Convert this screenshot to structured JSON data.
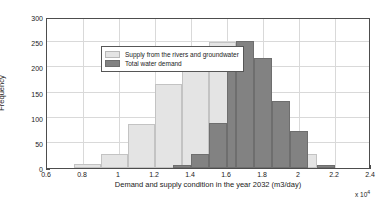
{
  "chart_data": {
    "type": "bar",
    "subtype": "histogram",
    "title": "",
    "xlabel": "Demand and supply condition in the year 2032 (m3/day)",
    "ylabel": "Frequency",
    "x_multiplier": "x 10",
    "x_multiplier_exponent": "4",
    "xlim": [
      0.6,
      2.4
    ],
    "ylim": [
      0,
      300
    ],
    "xticks": [
      0.6,
      0.8,
      1.0,
      1.2,
      1.4,
      1.6,
      1.8,
      2.0,
      2.2,
      2.4
    ],
    "xtick_labels": [
      "0.6",
      "0.8",
      "1",
      "1.2",
      "1.4",
      "1.6",
      "1.8",
      "2",
      "2.2",
      "2.4"
    ],
    "yticks": [
      0,
      50,
      100,
      150,
      200,
      250,
      300
    ],
    "ytick_labels": [
      "0",
      "50",
      "100",
      "150",
      "200",
      "250",
      "300"
    ],
    "grid": true,
    "legend_position": "upper left",
    "bin_width": 0.1,
    "series": [
      {
        "name": "Supply from the rivers and groundwater",
        "color": "#e4e4e4",
        "edge_color": "#c3c3c3",
        "bins": [
          {
            "start": 0.75,
            "end": 0.9,
            "value": 8
          },
          {
            "start": 0.9,
            "end": 1.05,
            "value": 28
          },
          {
            "start": 1.05,
            "end": 1.2,
            "value": 87
          },
          {
            "start": 1.2,
            "end": 1.35,
            "value": 167
          },
          {
            "start": 1.35,
            "end": 1.5,
            "value": 206
          },
          {
            "start": 1.5,
            "end": 1.65,
            "value": 250
          },
          {
            "start": 1.65,
            "end": 1.8,
            "value": 195
          },
          {
            "start": 2.0,
            "end": 2.1,
            "value": 28
          }
        ]
      },
      {
        "name": "Total  water demand",
        "color": "#828282",
        "edge_color": "#6e6e6e",
        "bins": [
          {
            "start": 1.3,
            "end": 1.4,
            "value": 5
          },
          {
            "start": 1.4,
            "end": 1.5,
            "value": 28
          },
          {
            "start": 1.5,
            "end": 1.6,
            "value": 89
          },
          {
            "start": 1.6,
            "end": 1.65,
            "value": 195
          },
          {
            "start": 1.65,
            "end": 1.75,
            "value": 253
          },
          {
            "start": 1.75,
            "end": 1.85,
            "value": 218
          },
          {
            "start": 1.85,
            "end": 1.95,
            "value": 133
          },
          {
            "start": 1.95,
            "end": 2.05,
            "value": 73
          },
          {
            "start": 2.1,
            "end": 2.2,
            "value": 5
          }
        ]
      }
    ],
    "legend": [
      "Supply from the rivers and groundwater",
      "Total  water demand"
    ]
  }
}
